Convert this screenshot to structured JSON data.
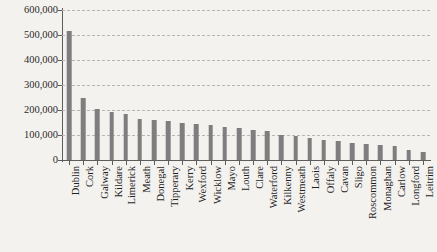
{
  "chart_data": {
    "type": "bar",
    "title": "",
    "subtitle": "",
    "xlabel": "",
    "ylabel": "",
    "ylim": [
      0,
      600000
    ],
    "ytick_labels": [
      "600,000",
      "500,000",
      "400,000",
      "300,000",
      "200,000",
      "100,000",
      "0"
    ],
    "ytick_values": [
      600000,
      500000,
      400000,
      300000,
      200000,
      100000,
      0
    ],
    "grid": true,
    "legend": null,
    "orientation": "vertical",
    "categories": [
      "Dublin",
      "Cork",
      "Galway",
      "Kildare",
      "Limerick",
      "Meath",
      "Donegal",
      "Tipperary",
      "Kerry",
      "Wexford",
      "Wicklow",
      "Mayo",
      "Louth",
      "Clare",
      "Waterford",
      "Kilkenny",
      "Westmeath",
      "Laois",
      "Offaly",
      "Cavan",
      "Sligo",
      "Roscommon",
      "Monaghan",
      "Carlow",
      "Longford",
      "Leitrim"
    ],
    "values": [
      515000,
      250000,
      205000,
      192000,
      185000,
      165000,
      160000,
      155000,
      148000,
      145000,
      142000,
      132000,
      128000,
      120000,
      116000,
      99000,
      95000,
      89000,
      80000,
      77000,
      69000,
      65000,
      62000,
      57000,
      41000,
      32000
    ],
    "series": [
      {
        "name": "Population",
        "values": [
          515000,
          250000,
          205000,
          192000,
          185000,
          165000,
          160000,
          155000,
          148000,
          145000,
          142000,
          132000,
          128000,
          120000,
          116000,
          99000,
          95000,
          89000,
          80000,
          77000,
          69000,
          65000,
          62000,
          57000,
          41000,
          32000
        ]
      }
    ],
    "colors": {
      "bar": "#7e7e7e",
      "background": "#f4f2ef",
      "axis": "#5d5d5d",
      "gridline": "#b9b7b4",
      "text": "#1f1f1f"
    }
  }
}
